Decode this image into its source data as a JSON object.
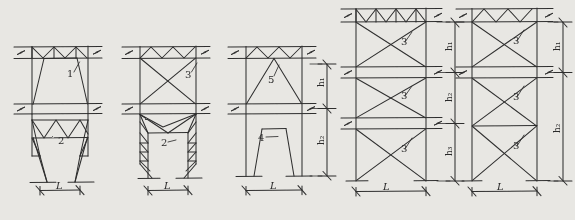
{
  "figure": {
    "kind": "hand-drawn-structural-truss-elevations",
    "background_color": "#e8e7e3",
    "ink_color": "#2f2f2f",
    "panel_count": 5
  },
  "panels": [
    {
      "id": "panel-1",
      "member_labels": [
        "1",
        "2"
      ],
      "span_label": "L",
      "height_labels": [],
      "top_band": "warren-zigzag",
      "upper_bay": "trapezoid-diagonal-brace",
      "lower_bay": "tapered-legs-zigzag-lattice"
    },
    {
      "id": "panel-2",
      "member_labels": [
        "3",
        "2"
      ],
      "span_label": "L",
      "height_labels": [],
      "top_band": "warren-zigzag",
      "upper_bay": "x-brace",
      "lower_bay": "tapered-legs-triangular-lattice"
    },
    {
      "id": "panel-3",
      "member_labels": [
        "5",
        "4"
      ],
      "span_label": "L",
      "height_labels": [
        "h₁",
        "h₂"
      ],
      "top_band": "warren-zigzag",
      "upper_bay": "a-frame-triangle-brace",
      "lower_bay": "solid-trapezoid-pier"
    },
    {
      "id": "panel-4",
      "member_labels": [
        "3",
        "3",
        "3"
      ],
      "span_label": "L",
      "height_labels": [
        "h₁",
        "h₂",
        "h₃"
      ],
      "top_band": "warren-zigzag",
      "bays": [
        "x-brace",
        "x-brace",
        "x-brace"
      ]
    },
    {
      "id": "panel-5",
      "member_labels": [
        "3",
        "3",
        "3"
      ],
      "span_label": "L",
      "height_labels": [
        "h₁",
        "h₂"
      ],
      "top_band": "warren-zigzag",
      "bays": [
        "x-brace",
        "x-brace-tall-double"
      ]
    }
  ],
  "symbols": {
    "break_mark": "Z-squiggle",
    "dimension_tick": "slash-arrow",
    "leader_line": "short-tick"
  }
}
